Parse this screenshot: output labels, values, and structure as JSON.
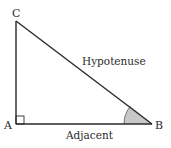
{
  "diagram": {
    "type": "right-triangle",
    "vertices": {
      "A": "A",
      "B": "B",
      "C": "C"
    },
    "sides": {
      "hypotenuse": "Hypotenuse",
      "adjacent": "Adjacent"
    },
    "right_angle_at": "A",
    "marked_angle_at": "B",
    "colors": {
      "stroke": "#2a2a2a",
      "angle_fill": "#c8c8c8"
    }
  }
}
